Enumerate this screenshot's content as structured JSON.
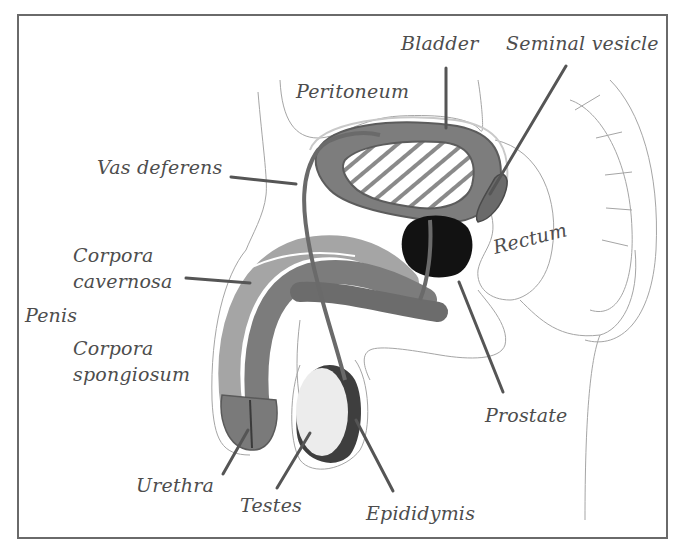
{
  "diagram": {
    "colors": {
      "frame": "#6a6a6a",
      "label_text": "#4d4d4d",
      "leader_line": "#555555",
      "tissue_dark": "#6b6b6b",
      "tissue_mid": "#8e8e8e",
      "tissue_light": "#b5b5b5",
      "prostate": "#111111",
      "testis": "#ececec",
      "outline": "#9a9a9a"
    },
    "labels": {
      "bladder": "Bladder",
      "seminal_vesicle": "Seminal vesicle",
      "peritoneum": "Peritoneum",
      "vas_deferens": "Vas deferens",
      "corpora_cavernosa_1": "Corpora",
      "corpora_cavernosa_2": "cavernosa",
      "penis": "Penis",
      "corpora_spongiosum_1": "Corpora",
      "corpora_spongiosum_2": "spongiosum",
      "rectum": "Rectum",
      "prostate": "Prostate",
      "urethra": "Urethra",
      "testes": "Testes",
      "epididymis": "Epididymis"
    }
  }
}
